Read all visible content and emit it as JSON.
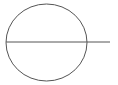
{
  "diagram": {
    "background": "#ffffff",
    "stroke_color": "#555555",
    "circle": {
      "cx": 46.5,
      "cy": 42.5,
      "rx": 40.5,
      "ry": 38.5,
      "stroke_width": 1
    },
    "line": {
      "x1": 6,
      "y1": 42,
      "x2": 110,
      "y2": 42,
      "stroke_width": 1
    }
  }
}
